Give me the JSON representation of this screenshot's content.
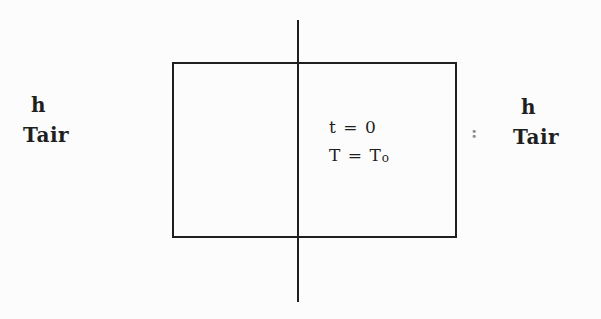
{
  "colors": {
    "ink": "#1f1f1f",
    "background": "#fcfcfc",
    "separator_gray": "#8f8f8f"
  },
  "diagram": {
    "left_boundary": {
      "convection_coefficient": "h",
      "air_temperature": "Tair"
    },
    "right_boundary": {
      "convection_coefficient": "h",
      "air_temperature": "Tair"
    },
    "separator": ":",
    "initial_condition": {
      "time_equation": "t = 0",
      "temperature_equation_main": "T = T",
      "temperature_equation_sub": "o"
    }
  }
}
